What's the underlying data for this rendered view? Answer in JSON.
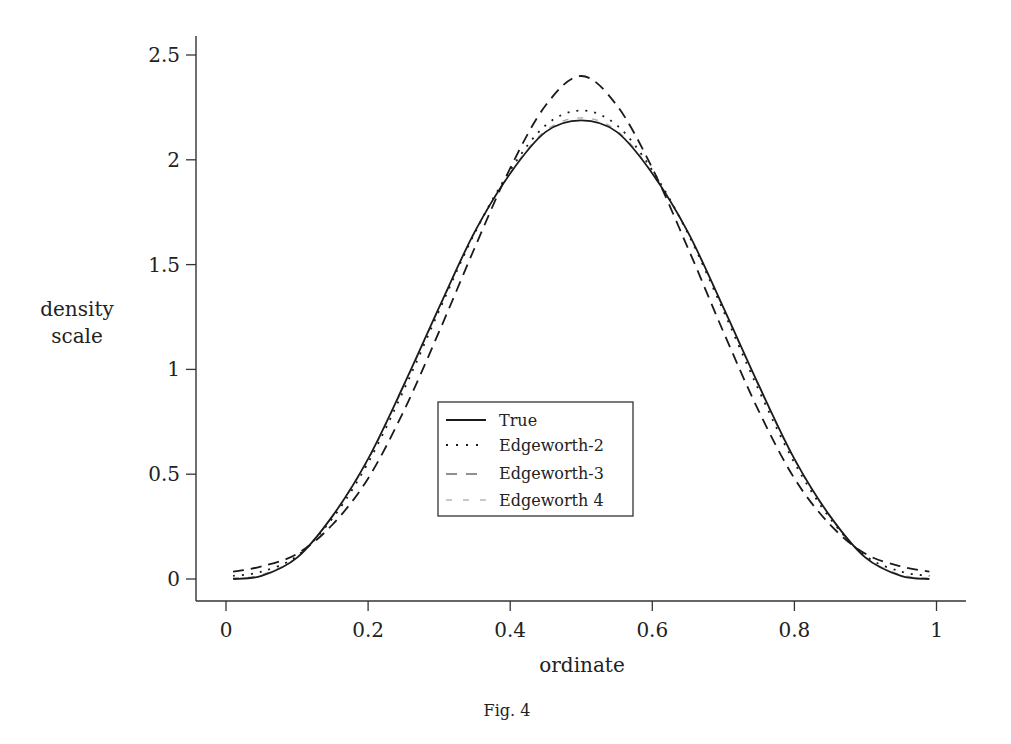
{
  "figure": {
    "caption": "Fig. 4"
  },
  "chart_data": {
    "type": "line",
    "title": "",
    "caption": "Fig. 4",
    "xlabel": "ordinate",
    "ylabel": "density\nscale",
    "ylabel_lines": [
      "density",
      "scale"
    ],
    "xlim": [
      0,
      1
    ],
    "ylim": [
      0,
      2.5
    ],
    "xticks": [
      0,
      0.2,
      0.4,
      0.6,
      0.8,
      1
    ],
    "xtick_labels": [
      "0",
      "0.2",
      "0.4",
      "0.6",
      "0.8",
      "1"
    ],
    "yticks": [
      0,
      0.5,
      1,
      1.5,
      2,
      2.5
    ],
    "ytick_labels": [
      "0",
      "0.5",
      "1",
      "1.5",
      "2",
      "2.5"
    ],
    "grid": false,
    "legend_position": "lower center (inside plot)",
    "x": [
      0.01,
      0.05,
      0.1,
      0.15,
      0.2,
      0.25,
      0.3,
      0.35,
      0.4,
      0.45,
      0.5,
      0.55,
      0.6,
      0.65,
      0.7,
      0.75,
      0.8,
      0.85,
      0.9,
      0.95,
      0.99
    ],
    "series": [
      {
        "name": "True",
        "style": "solid",
        "values": [
          0.0,
          0.015,
          0.102,
          0.301,
          0.573,
          0.923,
          1.296,
          1.656,
          1.935,
          2.133,
          2.188,
          2.133,
          1.935,
          1.656,
          1.296,
          0.923,
          0.573,
          0.301,
          0.102,
          0.015,
          0.0
        ]
      },
      {
        "name": "Edgeworth-2",
        "style": "dotted",
        "values": [
          0.015,
          0.035,
          0.11,
          0.29,
          0.555,
          0.9,
          1.28,
          1.65,
          1.95,
          2.165,
          2.235,
          2.165,
          1.95,
          1.65,
          1.28,
          0.9,
          0.555,
          0.29,
          0.11,
          0.035,
          0.015
        ]
      },
      {
        "name": "Edgeworth-3",
        "style": "dashed",
        "values": [
          0.035,
          0.06,
          0.12,
          0.26,
          0.48,
          0.8,
          1.18,
          1.58,
          1.96,
          2.26,
          2.4,
          2.26,
          1.96,
          1.58,
          1.18,
          0.8,
          0.48,
          0.26,
          0.12,
          0.06,
          0.035
        ]
      },
      {
        "name": "Edgeworth 4",
        "style": "dash-dot faint",
        "values": [
          0.005,
          0.02,
          0.105,
          0.298,
          0.568,
          0.918,
          1.292,
          1.654,
          1.938,
          2.14,
          2.2,
          2.14,
          1.938,
          1.654,
          1.292,
          0.918,
          0.568,
          0.298,
          0.105,
          0.02,
          0.005
        ]
      }
    ]
  },
  "legend": {
    "items": [
      {
        "label": "True"
      },
      {
        "label": "Edgeworth-2"
      },
      {
        "label": "Edgeworth-3"
      },
      {
        "label": "Edgeworth 4"
      }
    ]
  },
  "colors": {
    "line": "#1a1a1a",
    "faint_line": "#9a9a9a",
    "axis": "#333333",
    "background": "#ffffff"
  }
}
